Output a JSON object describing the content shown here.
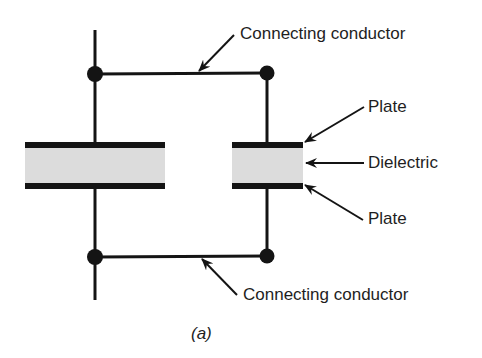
{
  "diagram": {
    "caption": "(a)",
    "labels": {
      "top_conductor": "Connecting conductor",
      "top_plate": "Plate",
      "dielectric": "Dielectric",
      "bottom_plate": "Plate",
      "bottom_conductor": "Connecting conductor"
    },
    "colors": {
      "line": "#141414",
      "dielectric_fill": "#dcdcdc",
      "background": "#ffffff"
    }
  }
}
